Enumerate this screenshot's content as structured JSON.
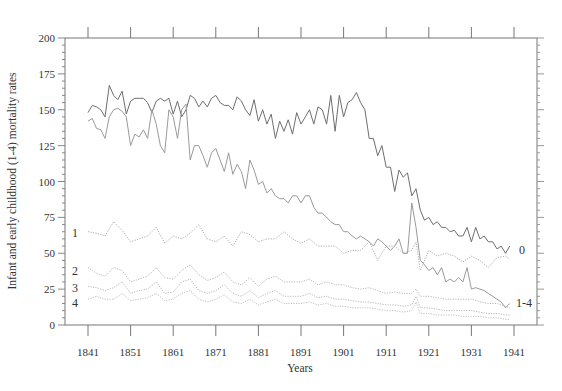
{
  "chart_data": {
    "type": "line",
    "title": "",
    "xlabel": "Years",
    "ylabel": "Infant and early childhood (1-4) mortality rates",
    "xlim": [
      1836,
      1946
    ],
    "ylim": [
      0,
      200
    ],
    "x_ticks": [
      1841,
      1851,
      1861,
      1871,
      1881,
      1891,
      1901,
      1911,
      1921,
      1931,
      1941
    ],
    "y_ticks": [
      0,
      25,
      50,
      75,
      100,
      125,
      150,
      175,
      200
    ],
    "grid": false,
    "legend_position": "inline labels",
    "series": [
      {
        "name": "0",
        "label_side": "right",
        "style": "solid",
        "color": "#6e6e6e",
        "x": [
          1841,
          1842,
          1843,
          1844,
          1845,
          1846,
          1847,
          1848,
          1849,
          1850,
          1851,
          1852,
          1853,
          1854,
          1855,
          1856,
          1857,
          1858,
          1859,
          1860,
          1861,
          1862,
          1863,
          1864,
          1865,
          1866,
          1867,
          1868,
          1869,
          1870,
          1871,
          1872,
          1873,
          1874,
          1875,
          1876,
          1877,
          1878,
          1879,
          1880,
          1881,
          1882,
          1883,
          1884,
          1885,
          1886,
          1887,
          1888,
          1889,
          1890,
          1891,
          1892,
          1893,
          1894,
          1895,
          1896,
          1897,
          1898,
          1899,
          1900,
          1901,
          1902,
          1903,
          1904,
          1905,
          1906,
          1907,
          1908,
          1909,
          1910,
          1911,
          1912,
          1913,
          1914,
          1915,
          1916,
          1917,
          1918,
          1919,
          1920,
          1921,
          1922,
          1923,
          1924,
          1925,
          1926,
          1927,
          1928,
          1929,
          1930,
          1931,
          1932,
          1933,
          1934,
          1935,
          1936,
          1937,
          1938,
          1939,
          1940
        ],
        "values": [
          148,
          153,
          152,
          150,
          145,
          167,
          160,
          157,
          163,
          147,
          156,
          158,
          158,
          158,
          155,
          148,
          156,
          158,
          156,
          158,
          147,
          156,
          145,
          150,
          160,
          158,
          152,
          156,
          152,
          158,
          160,
          155,
          153,
          153,
          150,
          159,
          156,
          150,
          146,
          157,
          142,
          150,
          140,
          147,
          130,
          142,
          135,
          143,
          133,
          148,
          140,
          145,
          150,
          140,
          152,
          150,
          140,
          160,
          135,
          160,
          145,
          155,
          157,
          162,
          155,
          150,
          130,
          130,
          118,
          125,
          110,
          110,
          93,
          108,
          103,
          106,
          90,
          95,
          80,
          73,
          75,
          70,
          72,
          68,
          68,
          65,
          66,
          62,
          62,
          68,
          58,
          68,
          60,
          62,
          58,
          58,
          53,
          55,
          50,
          55
        ]
      },
      {
        "name": "1-4",
        "label_side": "right",
        "style": "solid",
        "color": "#9a9a9a",
        "x": [
          1841,
          1842,
          1843,
          1844,
          1845,
          1846,
          1847,
          1848,
          1849,
          1850,
          1851,
          1852,
          1853,
          1854,
          1855,
          1856,
          1857,
          1858,
          1859,
          1860,
          1861,
          1862,
          1863,
          1864,
          1865,
          1866,
          1867,
          1868,
          1869,
          1870,
          1871,
          1872,
          1873,
          1874,
          1875,
          1876,
          1877,
          1878,
          1879,
          1880,
          1881,
          1882,
          1883,
          1884,
          1885,
          1886,
          1887,
          1888,
          1889,
          1890,
          1891,
          1892,
          1893,
          1894,
          1895,
          1896,
          1897,
          1898,
          1899,
          1900,
          1901,
          1902,
          1903,
          1904,
          1905,
          1906,
          1907,
          1908,
          1909,
          1910,
          1911,
          1912,
          1913,
          1914,
          1915,
          1916,
          1917,
          1918,
          1919,
          1920,
          1921,
          1922,
          1923,
          1924,
          1925,
          1926,
          1927,
          1928,
          1929,
          1930,
          1931,
          1932,
          1933,
          1934,
          1935,
          1936,
          1937,
          1938,
          1939,
          1940
        ],
        "values": [
          142,
          144,
          137,
          136,
          130,
          145,
          150,
          151,
          149,
          145,
          125,
          133,
          131,
          136,
          130,
          150,
          140,
          125,
          120,
          150,
          145,
          130,
          150,
          154,
          115,
          125,
          125,
          118,
          110,
          120,
          123,
          115,
          107,
          120,
          105,
          112,
          107,
          95,
          115,
          108,
          98,
          100,
          92,
          95,
          90,
          88,
          88,
          85,
          90,
          90,
          85,
          90,
          90,
          82,
          78,
          78,
          75,
          72,
          70,
          70,
          65,
          65,
          62,
          60,
          62,
          60,
          58,
          55,
          60,
          58,
          55,
          52,
          55,
          60,
          50,
          50,
          85,
          68,
          45,
          42,
          38,
          40,
          35,
          40,
          30,
          32,
          30,
          33,
          30,
          40,
          25,
          26,
          25,
          24,
          22,
          20,
          18,
          16,
          12,
          15
        ]
      },
      {
        "name": "1",
        "label_side": "left",
        "style": "dotted",
        "color": "#b0b0b0",
        "x": [
          1841,
          1843,
          1845,
          1847,
          1849,
          1851,
          1853,
          1855,
          1857,
          1859,
          1861,
          1863,
          1865,
          1867,
          1869,
          1871,
          1873,
          1875,
          1877,
          1879,
          1881,
          1883,
          1885,
          1887,
          1889,
          1891,
          1893,
          1895,
          1897,
          1899,
          1901,
          1903,
          1905,
          1907,
          1909,
          1911,
          1913,
          1915,
          1917,
          1918,
          1919,
          1921,
          1923,
          1925,
          1927,
          1929,
          1931,
          1933,
          1935,
          1937,
          1939,
          1940
        ],
        "values": [
          65,
          64,
          62,
          72,
          66,
          58,
          60,
          62,
          68,
          57,
          62,
          60,
          64,
          70,
          60,
          58,
          62,
          55,
          65,
          63,
          58,
          60,
          60,
          65,
          60,
          57,
          60,
          55,
          55,
          55,
          50,
          52,
          52,
          58,
          45,
          55,
          55,
          50,
          52,
          58,
          38,
          52,
          48,
          50,
          48,
          44,
          48,
          45,
          40,
          47,
          48,
          46
        ]
      },
      {
        "name": "2",
        "label_side": "left",
        "style": "dotted",
        "color": "#b8b8b8",
        "x": [
          1841,
          1843,
          1845,
          1847,
          1849,
          1851,
          1853,
          1855,
          1857,
          1859,
          1861,
          1863,
          1865,
          1867,
          1869,
          1871,
          1873,
          1875,
          1877,
          1879,
          1881,
          1883,
          1885,
          1887,
          1889,
          1891,
          1893,
          1895,
          1897,
          1899,
          1901,
          1903,
          1905,
          1907,
          1909,
          1911,
          1913,
          1915,
          1917,
          1918,
          1919,
          1921,
          1923,
          1925,
          1927,
          1929,
          1931,
          1933,
          1935,
          1937,
          1939,
          1940
        ],
        "values": [
          40,
          36,
          34,
          40,
          38,
          30,
          32,
          34,
          40,
          33,
          32,
          38,
          42,
          35,
          31,
          33,
          37,
          30,
          28,
          33,
          27,
          32,
          34,
          30,
          30,
          30,
          32,
          28,
          30,
          28,
          28,
          26,
          25,
          26,
          24,
          22,
          23,
          22,
          22,
          25,
          20,
          20,
          19,
          18,
          18,
          18,
          18,
          16,
          15,
          15,
          13,
          12
        ]
      },
      {
        "name": "3",
        "label_side": "left",
        "style": "dotted",
        "color": "#b8b8b8",
        "x": [
          1841,
          1843,
          1845,
          1847,
          1849,
          1851,
          1853,
          1855,
          1857,
          1859,
          1861,
          1863,
          1865,
          1867,
          1869,
          1871,
          1873,
          1875,
          1877,
          1879,
          1881,
          1883,
          1885,
          1887,
          1889,
          1891,
          1893,
          1895,
          1897,
          1899,
          1901,
          1903,
          1905,
          1907,
          1909,
          1911,
          1913,
          1915,
          1917,
          1918,
          1919,
          1921,
          1923,
          1925,
          1927,
          1929,
          1931,
          1933,
          1935,
          1937,
          1939,
          1940
        ],
        "values": [
          27,
          26,
          24,
          26,
          30,
          22,
          24,
          25,
          30,
          22,
          23,
          30,
          32,
          24,
          22,
          24,
          28,
          22,
          20,
          24,
          19,
          22,
          24,
          20,
          20,
          20,
          22,
          19,
          20,
          18,
          18,
          17,
          16,
          16,
          15,
          14,
          14,
          13,
          14,
          20,
          12,
          12,
          11,
          10,
          10,
          10,
          10,
          9,
          8,
          8,
          7,
          7
        ]
      },
      {
        "name": "4",
        "label_side": "left",
        "style": "dotted",
        "color": "#c0c0c0",
        "x": [
          1841,
          1843,
          1845,
          1847,
          1849,
          1851,
          1853,
          1855,
          1857,
          1859,
          1861,
          1863,
          1865,
          1867,
          1869,
          1871,
          1873,
          1875,
          1877,
          1879,
          1881,
          1883,
          1885,
          1887,
          1889,
          1891,
          1893,
          1895,
          1897,
          1899,
          1901,
          1903,
          1905,
          1907,
          1909,
          1911,
          1913,
          1915,
          1917,
          1918,
          1919,
          1921,
          1923,
          1925,
          1927,
          1929,
          1931,
          1933,
          1935,
          1937,
          1939,
          1940
        ],
        "values": [
          18,
          20,
          18,
          18,
          22,
          17,
          18,
          19,
          22,
          17,
          18,
          22,
          24,
          18,
          16,
          18,
          21,
          16,
          15,
          18,
          14,
          16,
          18,
          15,
          15,
          15,
          16,
          14,
          15,
          13,
          13,
          12,
          12,
          12,
          11,
          10,
          10,
          9,
          10,
          16,
          8,
          8,
          7,
          7,
          7,
          6,
          6,
          6,
          5,
          5,
          4,
          4
        ]
      }
    ]
  },
  "labels": {
    "xlabel": "Years",
    "ylabel": "Infant and early childhood (1-4) mortality rates",
    "series_0": "0",
    "series_14": "1-4",
    "series_1": "1",
    "series_2": "2",
    "series_3": "3",
    "series_4": "4"
  }
}
